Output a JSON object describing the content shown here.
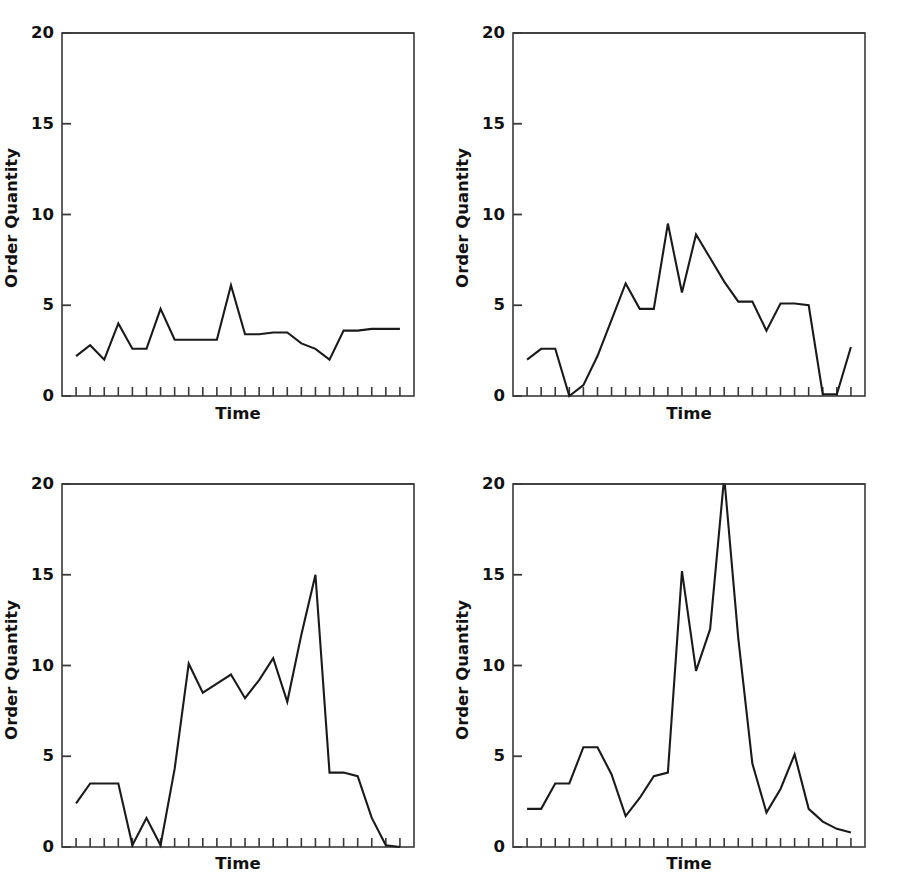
{
  "figure": {
    "background": "#ffffff",
    "line_color": "#1a1a1a",
    "axis_color": "#3a3a3a",
    "panel_count": 4
  },
  "axes": {
    "ylabel": "Order Quantity",
    "xlabel": "Time",
    "ytick_labels": [
      "0",
      "5",
      "10",
      "15",
      "20"
    ],
    "ytick_values": [
      0,
      5,
      10,
      15,
      20
    ],
    "ylim": [
      0,
      20
    ],
    "xtick_count": 24,
    "grid": false
  },
  "chart_data": [
    {
      "type": "line",
      "title": "Consumers Sales",
      "xlabel": "Time",
      "ylabel": "Order Quantity",
      "ylim": [
        0,
        20
      ],
      "xlim": [
        0,
        25
      ],
      "grid": false,
      "legend": null,
      "x": [
        1,
        2,
        3,
        4,
        5,
        6,
        7,
        8,
        9,
        10,
        11,
        12,
        13,
        14,
        15,
        16,
        17,
        18,
        19,
        20,
        21,
        22,
        23,
        24
      ],
      "values": [
        2.2,
        2.8,
        2.0,
        4.0,
        2.6,
        2.6,
        4.8,
        3.1,
        3.1,
        3.1,
        3.1,
        6.1,
        3.4,
        3.4,
        3.5,
        3.5,
        2.9,
        2.6,
        2.0,
        3.6,
        3.6,
        3.7,
        3.7,
        3.7
      ]
    },
    {
      "type": "line",
      "title": "Retailer‘s Orders to Wholesaler",
      "xlabel": "Time",
      "ylabel": "Order Quantity",
      "ylim": [
        0,
        20
      ],
      "xlim": [
        0,
        25
      ],
      "grid": false,
      "legend": null,
      "x": [
        1,
        2,
        3,
        4,
        5,
        6,
        7,
        8,
        9,
        10,
        11,
        12,
        13,
        14,
        15,
        16,
        17,
        18,
        19,
        20,
        21,
        22,
        23,
        24
      ],
      "values": [
        2.0,
        2.6,
        2.6,
        0.0,
        0.6,
        2.2,
        4.2,
        6.2,
        4.8,
        4.8,
        9.5,
        5.7,
        8.9,
        7.6,
        6.3,
        5.2,
        5.2,
        3.6,
        5.1,
        5.1,
        5.0,
        0.1,
        0.1,
        2.7
      ]
    },
    {
      "type": "line",
      "title": "Wholesaler‘s Orders to Manufacturer",
      "xlabel": "Time",
      "ylabel": "Order Quantity",
      "ylim": [
        0,
        20
      ],
      "xlim": [
        0,
        25
      ],
      "grid": false,
      "legend": null,
      "x": [
        1,
        2,
        3,
        4,
        5,
        6,
        7,
        8,
        9,
        10,
        11,
        12,
        13,
        14,
        15,
        16,
        17,
        18,
        19,
        20,
        21,
        22,
        23,
        24
      ],
      "values": [
        2.4,
        3.5,
        3.5,
        3.5,
        0.1,
        1.6,
        0.1,
        4.3,
        10.1,
        8.5,
        9.0,
        9.5,
        8.2,
        9.2,
        10.4,
        8.0,
        11.7,
        15.0,
        4.1,
        4.1,
        3.9,
        1.6,
        0.1,
        0.0
      ]
    },
    {
      "type": "line",
      "title": "Manufacturer‘s Orders to Supplier",
      "xlabel": "Time",
      "ylabel": "Order Quantity",
      "ylim": [
        0,
        20
      ],
      "xlim": [
        0,
        25
      ],
      "grid": false,
      "legend": null,
      "x": [
        1,
        2,
        3,
        4,
        5,
        6,
        7,
        8,
        9,
        10,
        11,
        12,
        13,
        14,
        15,
        16,
        17,
        18,
        19,
        20,
        21,
        22,
        23,
        24
      ],
      "values": [
        2.1,
        2.1,
        3.5,
        3.5,
        5.5,
        5.5,
        4.0,
        1.7,
        2.7,
        3.9,
        4.1,
        15.2,
        9.7,
        12.0,
        20.4,
        11.5,
        4.6,
        1.9,
        3.2,
        5.1,
        2.1,
        1.4,
        1.0,
        0.8
      ]
    }
  ]
}
